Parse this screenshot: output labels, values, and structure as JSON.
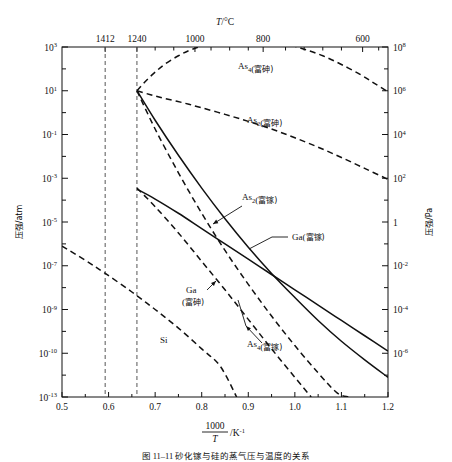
{
  "figure": {
    "top_axis_title": "T/°C",
    "bottom_axis_title_num": "1000",
    "bottom_axis_title_den": "T",
    "bottom_axis_title_unit": "/K⁻¹",
    "left_axis_title": "压强/atm",
    "right_axis_title": "压强/Pa",
    "caption": "图 11–11  砂化镓与硅的蒸气压与温度的关系"
  },
  "chart_data": {
    "type": "line",
    "title": "",
    "xlabel": "1000/T /K⁻¹",
    "ylabel": "压强/atm",
    "ylabel_right": "压强/Pa",
    "xlim": [
      0.5,
      1.2
    ],
    "ylim_log10": [
      -13,
      3
    ],
    "ylim_right_log10": [
      -8,
      8
    ],
    "grid": false,
    "legend": "inline-annotations",
    "x_ticks": [
      "0.5",
      "0.6",
      "0.7",
      "0.8",
      "0.9",
      "1.0",
      "1.1",
      "1.2"
    ],
    "x_tick_values": [
      0.5,
      0.6,
      0.7,
      0.8,
      0.9,
      1.0,
      1.1,
      1.2
    ],
    "y_ticks_left": [
      "10³",
      "10¹",
      "10⁻¹",
      "10⁻³",
      "10⁻⁵",
      "10⁻⁷",
      "10⁻⁹",
      "10⁻¹⁰",
      "10⁻¹³"
    ],
    "y_tick_left_exponents": [
      3,
      1,
      -1,
      -3,
      -5,
      -7,
      -9,
      -11,
      -13
    ],
    "y_ticks_right": [
      "10⁸",
      "10⁶",
      "10⁴",
      "10²",
      "1",
      "10⁻²",
      "10⁻⁴",
      "10⁻⁶"
    ],
    "y_tick_right_exponents": [
      8,
      6,
      4,
      2,
      0,
      -2,
      -4,
      -6
    ],
    "top_axis": {
      "label": "T/°C",
      "ticks": [
        {
          "label": "1412",
          "T_celsius": 1412,
          "x": 0.5927
        },
        {
          "label": "1240",
          "T_celsius": 1240,
          "x": 0.6609
        },
        {
          "label": "1000",
          "T_celsius": 1000,
          "x": 0.7855
        },
        {
          "label": "800",
          "T_celsius": 800,
          "x": 0.9319
        },
        {
          "label": "600",
          "T_celsius": 600,
          "x": 1.1455
        }
      ],
      "minor_ticks_x": [
        0.7,
        0.74,
        0.82,
        0.86,
        0.9,
        0.98,
        1.02,
        1.06,
        1.1,
        1.18
      ]
    },
    "vertical_markers": [
      {
        "name": "Si melting point",
        "label": "1412",
        "x": 0.5927,
        "style": "dashed"
      },
      {
        "name": "GaAs melting point",
        "label": "1240",
        "x": 0.6609,
        "style": "dashed"
      }
    ],
    "series": [
      {
        "name": "As4-arsenic-rich",
        "label": "As₄(富砷)",
        "style": "dashed",
        "label_x": 238,
        "label_y": 69,
        "points": [
          [
            0.661,
            1.0
          ],
          [
            0.68,
            1.45
          ],
          [
            0.7,
            1.85
          ],
          [
            0.72,
            2.2
          ],
          [
            0.75,
            2.6
          ],
          [
            0.78,
            2.9
          ],
          [
            0.82,
            3.15
          ],
          [
            0.86,
            3.3
          ],
          [
            0.9,
            3.35
          ],
          [
            0.94,
            3.3
          ],
          [
            0.98,
            3.15
          ],
          [
            1.02,
            2.9
          ],
          [
            1.06,
            2.6
          ],
          [
            1.1,
            2.2
          ],
          [
            1.14,
            1.75
          ],
          [
            1.17,
            1.35
          ],
          [
            1.2,
            0.95
          ]
        ]
      },
      {
        "name": "As2-arsenic-rich",
        "label": "As₂(富砷)",
        "style": "dashed",
        "label_x": 247,
        "label_y": 123,
        "points": [
          [
            0.661,
            1.0
          ],
          [
            0.69,
            0.82
          ],
          [
            0.72,
            0.65
          ],
          [
            0.76,
            0.45
          ],
          [
            0.8,
            0.22
          ],
          [
            0.85,
            -0.08
          ],
          [
            0.9,
            -0.4
          ],
          [
            0.95,
            -0.75
          ],
          [
            1.0,
            -1.15
          ],
          [
            1.05,
            -1.58
          ],
          [
            1.1,
            -2.05
          ],
          [
            1.15,
            -2.55
          ],
          [
            1.2,
            -3.05
          ]
        ]
      },
      {
        "name": "As2-gallium-rich",
        "label": "As₂(富镓)",
        "style": "solid",
        "label_x": 242,
        "label_y": 200,
        "leader": true,
        "points": [
          [
            0.661,
            1.0
          ],
          [
            0.7,
            -0.35
          ],
          [
            0.75,
            -1.95
          ],
          [
            0.8,
            -3.45
          ],
          [
            0.85,
            -4.85
          ],
          [
            0.9,
            -6.15
          ],
          [
            0.95,
            -7.35
          ],
          [
            1.0,
            -8.45
          ],
          [
            1.05,
            -9.5
          ],
          [
            1.1,
            -10.45
          ],
          [
            1.15,
            -11.3
          ],
          [
            1.2,
            -12.1
          ]
        ]
      },
      {
        "name": "Ga-gallium-rich",
        "label": "Ga(富镓)",
        "style": "solid",
        "label_x": 292,
        "label_y": 240,
        "leader": true,
        "points": [
          [
            0.661,
            -3.5
          ],
          [
            0.7,
            -3.95
          ],
          [
            0.75,
            -4.6
          ],
          [
            0.8,
            -5.3
          ],
          [
            0.85,
            -6.0
          ],
          [
            0.9,
            -6.7
          ],
          [
            0.95,
            -7.4
          ],
          [
            1.0,
            -8.1
          ],
          [
            1.05,
            -8.8
          ],
          [
            1.1,
            -9.5
          ],
          [
            1.15,
            -10.2
          ],
          [
            1.2,
            -10.9
          ]
        ]
      },
      {
        "name": "Ga-arsenic-rich",
        "label": "Ga(富砷)",
        "style": "dashed",
        "label_x": 186,
        "label_y": 293,
        "leader": true,
        "points": [
          [
            0.661,
            -3.45
          ],
          [
            0.7,
            -4.3
          ],
          [
            0.75,
            -5.5
          ],
          [
            0.8,
            -6.8
          ],
          [
            0.85,
            -8.1
          ],
          [
            0.9,
            -9.45
          ],
          [
            0.95,
            -10.8
          ],
          [
            1.0,
            -12.1
          ],
          [
            1.035,
            -13.0
          ]
        ]
      },
      {
        "name": "As4-gallium-rich",
        "label": "As₄(富镓)",
        "style": "dashed",
        "label_x": 247,
        "label_y": 347,
        "leader": true,
        "points": [
          [
            0.661,
            1.0
          ],
          [
            0.7,
            -0.75
          ],
          [
            0.75,
            -2.75
          ],
          [
            0.8,
            -4.6
          ],
          [
            0.85,
            -6.3
          ],
          [
            0.9,
            -7.85
          ],
          [
            0.95,
            -9.3
          ],
          [
            1.0,
            -10.65
          ],
          [
            1.05,
            -11.9
          ],
          [
            1.09,
            -12.8
          ],
          [
            1.115,
            -13.0
          ]
        ]
      },
      {
        "name": "Si",
        "label": "Si",
        "style": "dashed",
        "label_x": 160,
        "label_y": 343,
        "points": [
          [
            0.5,
            -6.1
          ],
          [
            0.55,
            -6.75
          ],
          [
            0.593,
            -7.35
          ],
          [
            0.65,
            -8.2
          ],
          [
            0.7,
            -9.0
          ],
          [
            0.75,
            -9.85
          ],
          [
            0.8,
            -10.8
          ],
          [
            0.84,
            -11.6
          ],
          [
            0.875,
            -13.0
          ]
        ]
      }
    ]
  }
}
